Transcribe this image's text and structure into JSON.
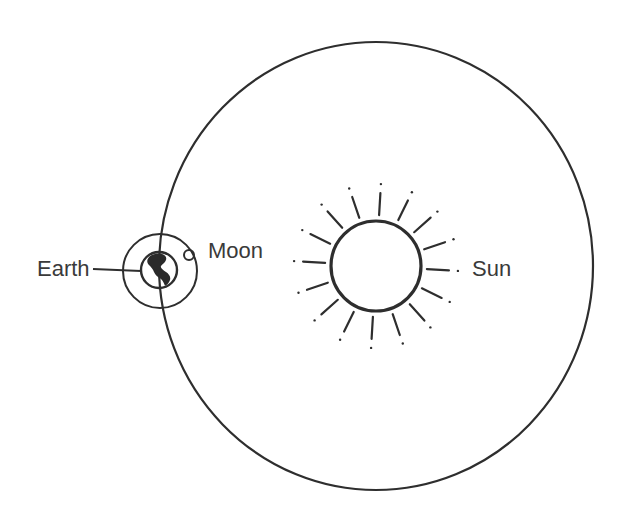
{
  "diagram": {
    "type": "earth-moon-sun-orbit",
    "labels": {
      "earth": "Earth",
      "moon": "Moon",
      "sun": "Sun"
    },
    "colors": {
      "ink": "#2e2e2e",
      "text": "#3a3a3a",
      "background": "#ffffff"
    },
    "geometry": {
      "earth_orbit": {
        "cx": 376,
        "cy": 266,
        "rx": 217,
        "ry": 224
      },
      "sun": {
        "cx": 376,
        "cy": 266,
        "r": 45,
        "ray_count": 16,
        "ray_inner": 51,
        "ray_outer": 73,
        "ray_dot": 82
      },
      "earth": {
        "cx": 159,
        "cy": 270,
        "r": 18
      },
      "moon_orbit": {
        "cx": 160,
        "cy": 271,
        "r": 37
      },
      "moon": {
        "cx": 189,
        "cy": 255,
        "r": 5
      }
    }
  }
}
